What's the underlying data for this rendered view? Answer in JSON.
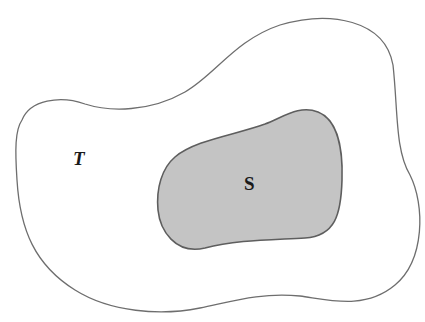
{
  "diagram": {
    "type": "set-containment",
    "outer_set": {
      "label": "T",
      "fill": "#ffffff",
      "stroke": "#6e6e6e"
    },
    "inner_set": {
      "label": "S",
      "fill": "#c4c4c4",
      "stroke": "#5e5e5e"
    }
  }
}
